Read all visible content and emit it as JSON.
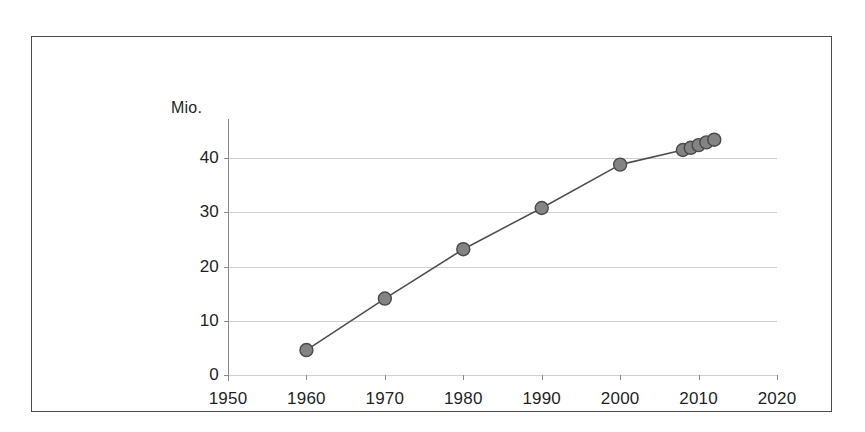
{
  "chart_data": {
    "type": "line",
    "title": "",
    "subtitle": "",
    "xlabel": "",
    "ylabel": "",
    "unit_label": "Mio.",
    "grid": true,
    "legend": "none",
    "xlim": [
      1950,
      2020
    ],
    "ylim": [
      0,
      45
    ],
    "x_ticks": [
      1950,
      1960,
      1970,
      1980,
      1990,
      2000,
      2010,
      2020
    ],
    "y_ticks": [
      0,
      10,
      20,
      30,
      40
    ],
    "series": [
      {
        "name": "Mio.",
        "marker": "circle",
        "color": "#848484",
        "line_color": "#4f4f4f",
        "points": [
          {
            "x": 1960,
            "y": 4.6
          },
          {
            "x": 1970,
            "y": 14.1
          },
          {
            "x": 1980,
            "y": 23.2
          },
          {
            "x": 1990,
            "y": 30.8
          },
          {
            "x": 2000,
            "y": 38.8
          },
          {
            "x": 2008,
            "y": 41.5
          },
          {
            "x": 2009,
            "y": 41.9
          },
          {
            "x": 2010,
            "y": 42.4
          },
          {
            "x": 2011,
            "y": 42.9
          },
          {
            "x": 2012,
            "y": 43.4
          }
        ]
      }
    ],
    "x": [
      1960,
      1970,
      1980,
      1990,
      2000,
      2008,
      2009,
      2010,
      2011,
      2012
    ],
    "values": [
      4.6,
      14.1,
      23.2,
      30.8,
      38.8,
      41.5,
      41.9,
      42.4,
      42.9,
      43.4
    ]
  },
  "axes": {
    "y_tick_labels": [
      "0",
      "10",
      "20",
      "30",
      "40"
    ],
    "x_tick_labels": [
      "1950",
      "1960",
      "1970",
      "1980",
      "1990",
      "2000",
      "2010",
      "2020"
    ]
  },
  "colors": {
    "frame": "#4a4a4a",
    "grid": "#cfcfcf",
    "axis": "#8a8a8a",
    "marker_fill": "#848484",
    "marker_stroke": "#4a4a4a",
    "line": "#4f4f4f",
    "text": "#1f1f1f",
    "background": "#ffffff"
  }
}
